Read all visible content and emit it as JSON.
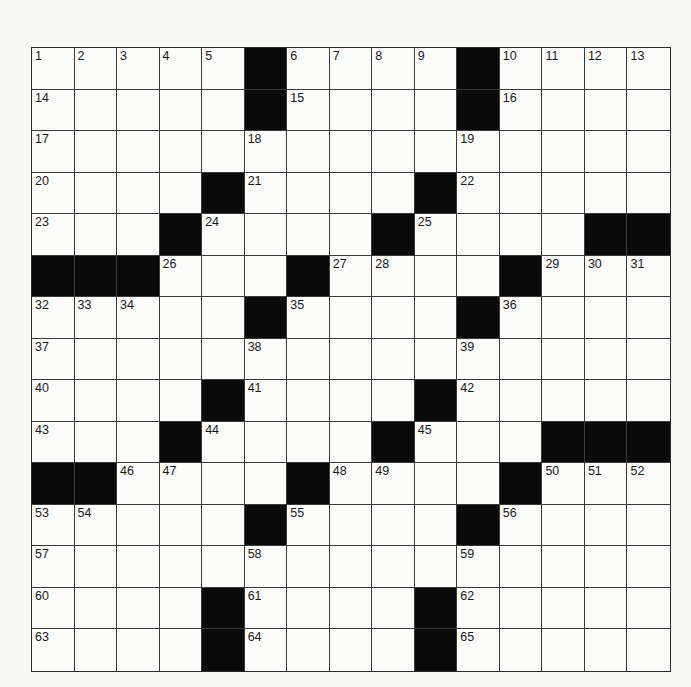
{
  "puzzle": {
    "size": {
      "rows": 15,
      "cols": 15
    },
    "colors": {
      "black": "#0a0a0a",
      "white": "#fbfbfa",
      "line": "#3a3a3a"
    },
    "rows": [
      [
        "1",
        "2",
        "3",
        "4",
        "5",
        "#",
        "6",
        "7",
        "8",
        "9",
        "#",
        "10",
        "11",
        "12",
        "13"
      ],
      [
        "14",
        "",
        "",
        "",
        "",
        "#",
        "15",
        "",
        "",
        "",
        "#",
        "16",
        "",
        "",
        ""
      ],
      [
        "17",
        "",
        "",
        "",
        "",
        "18",
        "",
        "",
        "",
        "",
        "19",
        "",
        "",
        "",
        ""
      ],
      [
        "20",
        "",
        "",
        "",
        "#",
        "21",
        "",
        "",
        "",
        "#",
        "22",
        "",
        "",
        "",
        ""
      ],
      [
        "23",
        "",
        "",
        "#",
        "24",
        "",
        "",
        "",
        "#",
        "25",
        "",
        "",
        "",
        "#",
        "#"
      ],
      [
        "#",
        "#",
        "#",
        "26",
        "",
        "",
        "#",
        "27",
        "28",
        "",
        "",
        "#",
        "29",
        "30",
        "31"
      ],
      [
        "32",
        "33",
        "34",
        "",
        "",
        "#",
        "35",
        "",
        "",
        "",
        "#",
        "36",
        "",
        "",
        ""
      ],
      [
        "37",
        "",
        "",
        "",
        "",
        "38",
        "",
        "",
        "",
        "",
        "39",
        "",
        "",
        "",
        ""
      ],
      [
        "40",
        "",
        "",
        "",
        "#",
        "41",
        "",
        "",
        "",
        "#",
        "42",
        "",
        "",
        "",
        ""
      ],
      [
        "43",
        "",
        "",
        "#",
        "44",
        "",
        "",
        "",
        "#",
        "45",
        "",
        "",
        "#",
        "#",
        "#"
      ],
      [
        "#",
        "#",
        "46",
        "47",
        "",
        "",
        "#",
        "48",
        "49",
        "",
        "",
        "#",
        "50",
        "51",
        "52"
      ],
      [
        "53",
        "54",
        "",
        "",
        "",
        "#",
        "55",
        "",
        "",
        "",
        "#",
        "56",
        "",
        "",
        ""
      ],
      [
        "57",
        "",
        "",
        "",
        "",
        "58",
        "",
        "",
        "",
        "",
        "59",
        "",
        "",
        "",
        ""
      ],
      [
        "60",
        "",
        "",
        "",
        "#",
        "61",
        "",
        "",
        "",
        "#",
        "62",
        "",
        "",
        "",
        ""
      ],
      [
        "63",
        "",
        "",
        "",
        "#",
        "64",
        "",
        "",
        "",
        "#",
        "65",
        "",
        "",
        "",
        ""
      ]
    ]
  }
}
